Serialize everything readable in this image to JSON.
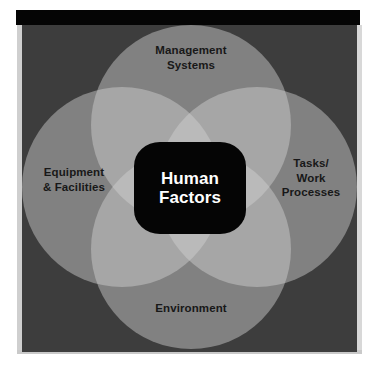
{
  "diagram": {
    "center": {
      "line1": "Human",
      "line2": "Factors"
    },
    "circles": [
      {
        "id": "management",
        "position": "top",
        "label_lines": [
          "Management",
          "Systems"
        ]
      },
      {
        "id": "equipment",
        "position": "left",
        "label_lines": [
          "Equipment",
          "& Facilities"
        ]
      },
      {
        "id": "tasks",
        "position": "right",
        "label_lines": [
          "Tasks/",
          "Work",
          "Processes"
        ]
      },
      {
        "id": "environment",
        "position": "bottom",
        "label_lines": [
          "Environment"
        ]
      }
    ],
    "colors": {
      "background": "#3d3d3d",
      "circle_fill": "#d2d2d2",
      "center_fill": "#050505",
      "center_text": "#ffffff",
      "label_text": "#181818",
      "frame_bar": "#050505",
      "page": "#ffffff"
    }
  }
}
